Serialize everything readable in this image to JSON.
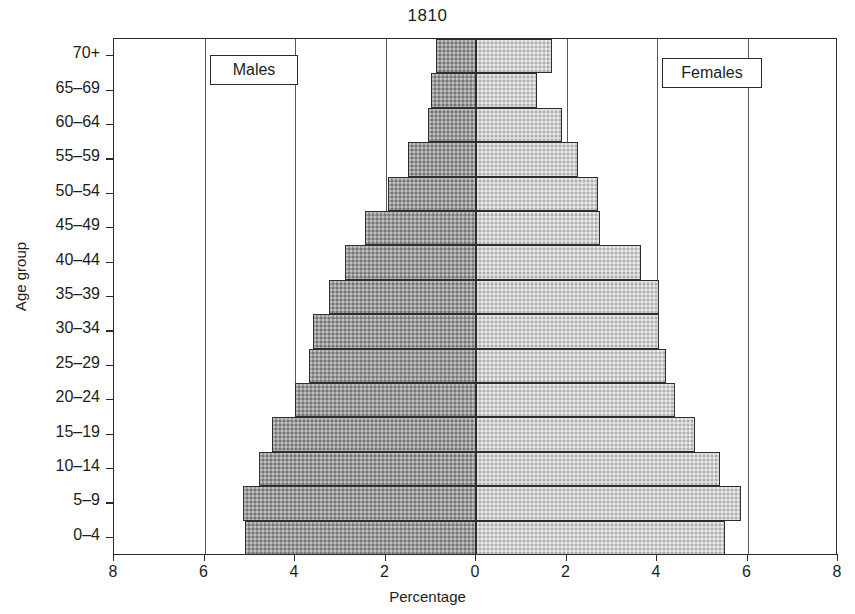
{
  "chart_data": {
    "type": "bar",
    "subtype": "population-pyramid",
    "title": "1810",
    "xlabel": "Percentage",
    "ylabel": "Age group",
    "categories": [
      "0–4",
      "5–9",
      "10–14",
      "15–19",
      "20–24",
      "25–29",
      "30–34",
      "35–39",
      "40–44",
      "45–49",
      "50–54",
      "55–59",
      "60–64",
      "65–69",
      "70+"
    ],
    "series": [
      {
        "name": "Males",
        "side": "left",
        "values": [
          5.1,
          5.15,
          4.8,
          4.5,
          4.0,
          3.7,
          3.6,
          3.25,
          2.9,
          2.45,
          1.95,
          1.5,
          1.05,
          1.0,
          0.88
        ]
      },
      {
        "name": "Females",
        "side": "right",
        "values": [
          5.5,
          5.85,
          5.4,
          4.85,
          4.4,
          4.2,
          4.05,
          4.05,
          3.65,
          2.75,
          2.7,
          2.25,
          1.9,
          1.35,
          1.68
        ]
      }
    ],
    "xticks": [
      8,
      6,
      4,
      2,
      0,
      2,
      4,
      6,
      8
    ],
    "xlim": [
      -8,
      8
    ],
    "grid": "vertical",
    "gridline_values": [
      6,
      4,
      2,
      0,
      2,
      4,
      6
    ],
    "legend_position": "inside-top-left-and-top-right",
    "colors": {
      "males": "#9a9a9a",
      "females": "#cfcfcf",
      "axis": "#2b2b2b",
      "background": "#ffffff"
    }
  },
  "legend": {
    "males_label": "Males",
    "females_label": "Females"
  }
}
